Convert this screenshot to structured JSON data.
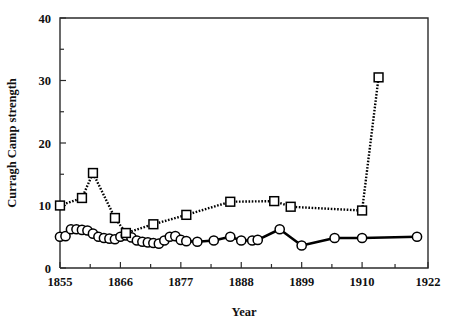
{
  "chart_data": {
    "type": "line",
    "title": "",
    "xlabel": "Year",
    "ylabel": "Curragh Camp strength",
    "xlim": [
      1855,
      1922
    ],
    "ylim": [
      0,
      40
    ],
    "grid": false,
    "legend": "none",
    "x_ticks_major": [
      1855,
      1866,
      1877,
      1888,
      1899,
      1910,
      1922
    ],
    "x_tick_labels": [
      "1855",
      "1866",
      "1877",
      "1888",
      "1899",
      "1910",
      "1922"
    ],
    "x_ticks_minor": [
      1860.5,
      1871.5,
      1882.5,
      1893.5,
      1904.5,
      1916
    ],
    "y_ticks_major": [
      0,
      10,
      20,
      30,
      40
    ],
    "y_tick_labels": [
      "0",
      "10",
      "20",
      "30",
      "40"
    ],
    "y_ticks_minor": [
      5,
      15,
      25,
      35
    ],
    "series": [
      {
        "name": "circles-series",
        "marker": "circle",
        "linestyle": "solid",
        "points": [
          [
            1855,
            5.0
          ],
          [
            1856,
            5.1
          ],
          [
            1857,
            6.2
          ],
          [
            1858,
            6.2
          ],
          [
            1859,
            6.1
          ],
          [
            1860,
            6.0
          ],
          [
            1861,
            5.5
          ],
          [
            1862,
            5.0
          ],
          [
            1863,
            4.8
          ],
          [
            1864,
            4.7
          ],
          [
            1865,
            4.6
          ],
          [
            1866,
            5.0
          ],
          [
            1867,
            5.2
          ],
          [
            1868,
            4.9
          ],
          [
            1869,
            4.4
          ],
          [
            1870,
            4.2
          ],
          [
            1871,
            4.1
          ],
          [
            1872,
            4.0
          ],
          [
            1873,
            3.9
          ],
          [
            1874,
            4.4
          ],
          [
            1875,
            5.0
          ],
          [
            1876,
            5.1
          ],
          [
            1877,
            4.5
          ],
          [
            1878,
            4.3
          ],
          [
            1880,
            4.2
          ],
          [
            1883,
            4.4
          ],
          [
            1886,
            5.0
          ],
          [
            1888,
            4.4
          ],
          [
            1890,
            4.4
          ],
          [
            1891,
            4.5
          ],
          [
            1895,
            6.2
          ],
          [
            1899,
            3.6
          ],
          [
            1905,
            4.8
          ],
          [
            1910,
            4.8
          ],
          [
            1920,
            5.0
          ]
        ]
      },
      {
        "name": "squares-series",
        "marker": "square",
        "linestyle": "dotted",
        "points": [
          [
            1855,
            10.0
          ],
          [
            1859,
            11.2
          ],
          [
            1861,
            15.2
          ],
          [
            1865,
            8.0
          ],
          [
            1867,
            5.6
          ],
          [
            1872,
            7.0
          ],
          [
            1878,
            8.5
          ],
          [
            1886,
            10.6
          ],
          [
            1894,
            10.7
          ],
          [
            1897,
            9.8
          ],
          [
            1910,
            9.2
          ],
          [
            1913,
            30.5
          ]
        ]
      }
    ]
  }
}
